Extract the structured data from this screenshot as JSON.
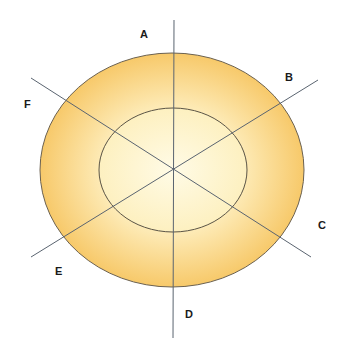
{
  "diagram": {
    "labels": {
      "A": "A",
      "B": "B",
      "C": "C",
      "D": "D",
      "E": "E",
      "F": "F"
    },
    "colors": {
      "outer_ring_edge": "#f7c96a",
      "outer_ring_mid": "#fce3a3",
      "inner_center": "#fffbe3",
      "inner_edge": "#fdf1c2",
      "stroke": "#555555",
      "axis_line": "#5a6470"
    },
    "shapes": {
      "outer_ellipse": {
        "cx": 172,
        "cy": 170,
        "rx": 132,
        "ry": 117
      },
      "inner_ellipse": {
        "cx": 173,
        "cy": 170,
        "rx": 74,
        "ry": 62
      }
    }
  }
}
